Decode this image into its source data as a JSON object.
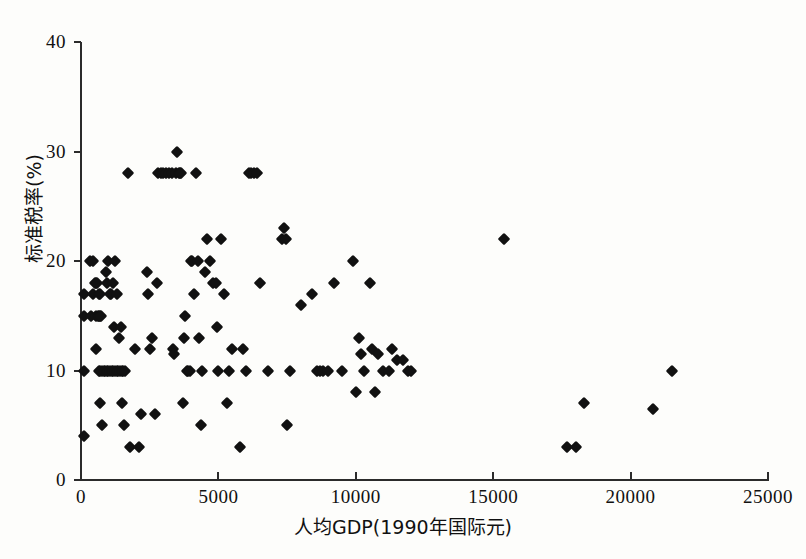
{
  "figure": {
    "background_color": "#fdfdfb",
    "marker_color": "#111111",
    "axis_color": "#2b2b2b"
  },
  "chart_data": {
    "type": "scatter",
    "title": "",
    "xlabel": "人均GDP(1990年国际元)",
    "ylabel": "标准税率(%)",
    "xlim": [
      0,
      25000
    ],
    "ylim": [
      0,
      40
    ],
    "xticks": [
      0,
      5000,
      10000,
      15000,
      20000,
      25000
    ],
    "yticks": [
      0,
      10,
      20,
      30,
      40
    ],
    "xticklabels": [
      "0",
      "5000",
      "10000",
      "15000",
      "20000",
      "25000"
    ],
    "yticklabels": [
      "0",
      "10",
      "20",
      "30",
      "40"
    ],
    "grid": false,
    "legend": null,
    "marker": "diamond",
    "series": [
      {
        "name": "国家观测值",
        "points": [
          [
            120,
            17
          ],
          [
            120,
            15
          ],
          [
            120,
            10
          ],
          [
            120,
            4
          ],
          [
            330,
            20
          ],
          [
            420,
            20
          ],
          [
            430,
            17
          ],
          [
            380,
            15
          ],
          [
            500,
            18
          ],
          [
            560,
            18
          ],
          [
            600,
            18
          ],
          [
            640,
            17
          ],
          [
            700,
            17
          ],
          [
            560,
            15
          ],
          [
            620,
            15
          ],
          [
            660,
            15
          ],
          [
            700,
            15
          ],
          [
            740,
            15
          ],
          [
            560,
            12
          ],
          [
            640,
            10
          ],
          [
            700,
            10
          ],
          [
            760,
            10
          ],
          [
            820,
            10
          ],
          [
            880,
            10
          ],
          [
            940,
            10
          ],
          [
            1000,
            10
          ],
          [
            1060,
            10
          ],
          [
            1120,
            10
          ],
          [
            1180,
            10
          ],
          [
            1240,
            10
          ],
          [
            1300,
            10
          ],
          [
            1360,
            10
          ],
          [
            1420,
            10
          ],
          [
            1480,
            10
          ],
          [
            1540,
            10
          ],
          [
            1600,
            10
          ],
          [
            700,
            7
          ],
          [
            760,
            5
          ],
          [
            900,
            19
          ],
          [
            950,
            18
          ],
          [
            1000,
            20
          ],
          [
            1050,
            17
          ],
          [
            1100,
            17
          ],
          [
            1150,
            18
          ],
          [
            1200,
            14
          ],
          [
            1250,
            20
          ],
          [
            1300,
            17
          ],
          [
            1400,
            13
          ],
          [
            1450,
            14
          ],
          [
            1500,
            7
          ],
          [
            1550,
            5
          ],
          [
            1700,
            28
          ],
          [
            1800,
            3
          ],
          [
            1950,
            12
          ],
          [
            2100,
            3
          ],
          [
            2200,
            6
          ],
          [
            2400,
            19
          ],
          [
            2450,
            17
          ],
          [
            2500,
            12
          ],
          [
            2600,
            13
          ],
          [
            2700,
            6
          ],
          [
            2750,
            18
          ],
          [
            2800,
            28
          ],
          [
            2900,
            28
          ],
          [
            3000,
            28
          ],
          [
            3100,
            28
          ],
          [
            3200,
            28
          ],
          [
            3300,
            28
          ],
          [
            3350,
            12
          ],
          [
            3400,
            11.5
          ],
          [
            3450,
            28
          ],
          [
            3500,
            30
          ],
          [
            3550,
            28
          ],
          [
            3600,
            28
          ],
          [
            3650,
            28
          ],
          [
            3700,
            7
          ],
          [
            3750,
            13
          ],
          [
            3800,
            15
          ],
          [
            3850,
            10
          ],
          [
            3900,
            10
          ],
          [
            3950,
            10
          ],
          [
            4000,
            20
          ],
          [
            4050,
            20
          ],
          [
            4100,
            17
          ],
          [
            4200,
            28
          ],
          [
            4250,
            20
          ],
          [
            4300,
            13
          ],
          [
            4350,
            5
          ],
          [
            4400,
            10
          ],
          [
            4500,
            19
          ],
          [
            4600,
            22
          ],
          [
            4700,
            20
          ],
          [
            4800,
            18
          ],
          [
            4900,
            18
          ],
          [
            4950,
            14
          ],
          [
            5000,
            10
          ],
          [
            5100,
            22
          ],
          [
            5200,
            17
          ],
          [
            5300,
            7
          ],
          [
            5400,
            10
          ],
          [
            5500,
            12
          ],
          [
            5800,
            3
          ],
          [
            5900,
            12
          ],
          [
            6000,
            10
          ],
          [
            6100,
            28
          ],
          [
            6200,
            28
          ],
          [
            6300,
            28
          ],
          [
            6400,
            28
          ],
          [
            6500,
            18
          ],
          [
            6800,
            10
          ],
          [
            7300,
            22
          ],
          [
            7400,
            23
          ],
          [
            7450,
            22
          ],
          [
            7500,
            5
          ],
          [
            7600,
            10
          ],
          [
            8000,
            16
          ],
          [
            8400,
            17
          ],
          [
            8600,
            10
          ],
          [
            8700,
            10
          ],
          [
            8800,
            10
          ],
          [
            9000,
            10
          ],
          [
            9200,
            18
          ],
          [
            9500,
            10
          ],
          [
            9900,
            20
          ],
          [
            10000,
            8
          ],
          [
            10100,
            13
          ],
          [
            10200,
            11.5
          ],
          [
            10300,
            10
          ],
          [
            10500,
            18
          ],
          [
            10600,
            12
          ],
          [
            10700,
            8
          ],
          [
            10800,
            11.5
          ],
          [
            11000,
            10
          ],
          [
            11200,
            10
          ],
          [
            11300,
            12
          ],
          [
            11500,
            11
          ],
          [
            11700,
            11
          ],
          [
            11900,
            10
          ],
          [
            12000,
            10
          ],
          [
            15400,
            22
          ],
          [
            17700,
            3
          ],
          [
            18000,
            3
          ],
          [
            18300,
            7
          ],
          [
            20800,
            6.5
          ],
          [
            21500,
            10
          ]
        ]
      }
    ]
  }
}
